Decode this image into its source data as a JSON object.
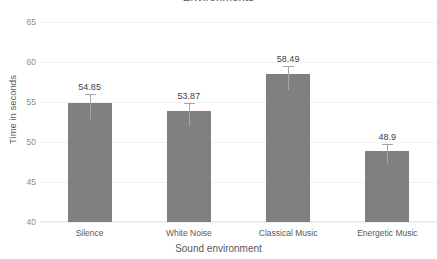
{
  "chart_data": {
    "type": "bar",
    "title": "Environments",
    "xlabel": "Sound environment",
    "ylabel": "Time in seconds",
    "categories": [
      "Silence",
      "White Noise",
      "Classical Music",
      "Energetic Music"
    ],
    "values": [
      54.85,
      53.87,
      58.49,
      48.9
    ],
    "value_labels": [
      "54.85",
      "53.87",
      "58.49",
      "48.9"
    ],
    "errors_upper": [
      1.1,
      1.0,
      1.0,
      0.8
    ],
    "errors_lower": [
      2.0,
      1.9,
      2.0,
      1.7
    ],
    "ylim": [
      40,
      65
    ],
    "yticks": [
      65,
      60,
      55,
      50,
      45,
      40
    ],
    "ytick_labels": [
      "65",
      "60",
      "55",
      "50",
      "45",
      "40"
    ],
    "grid": true,
    "legend": false,
    "bar_color": "#808080",
    "error_color": "#a6a6a6",
    "grid_color": "#f2f2f2",
    "text_color": "#595959"
  }
}
